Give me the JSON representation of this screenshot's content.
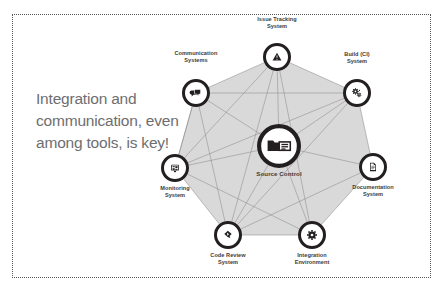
{
  "slide": {
    "headline": "Integration and communication, even among tools, is key!",
    "headline_color": "#6e6e70",
    "background_color": "#ffffff",
    "border_style": "dotted",
    "border_color": "#555555"
  },
  "diagram": {
    "type": "network",
    "shape": "heptagon",
    "polygon_fill": "#d9d9d9",
    "node_ring_color": "#231f20",
    "link_color": "#8c8c8c",
    "center_node": {
      "label": "Source Control",
      "icon": "folder-server-icon",
      "x": 279,
      "y": 146,
      "radius": 22
    },
    "nodes": [
      {
        "id": "issue-tracking",
        "label": "Issue Tracking\nSystem",
        "icon": "warning-triangle-icon",
        "x": 277,
        "y": 57,
        "radius": 14,
        "label_x": 277,
        "label_y": 30
      },
      {
        "id": "build-ci",
        "label": "Build (CI)\nSystem",
        "icon": "gears-icon",
        "x": 357,
        "y": 93,
        "radius": 14,
        "label_x": 357,
        "label_y": 65
      },
      {
        "id": "documentation",
        "label": "Documentation\nSystem",
        "icon": "document-page-icon",
        "x": 373,
        "y": 167,
        "radius": 14,
        "label_x": 373,
        "label_y": 184
      },
      {
        "id": "integration-env",
        "label": "Integration\nEnvironment",
        "icon": "gear-icon",
        "x": 312,
        "y": 235,
        "radius": 14,
        "label_x": 312,
        "label_y": 252
      },
      {
        "id": "code-review",
        "label": "Code Review\nSystem",
        "icon": "stamp-review-icon",
        "x": 228,
        "y": 235,
        "radius": 14,
        "label_x": 228,
        "label_y": 252
      },
      {
        "id": "monitoring",
        "label": "Monitoring\nSystem",
        "icon": "monitor-dashboard-icon",
        "x": 175,
        "y": 168,
        "radius": 14,
        "label_x": 175,
        "label_y": 185
      },
      {
        "id": "communication",
        "label": "Communication\nSystems",
        "icon": "speech-bubbles-icon",
        "x": 196,
        "y": 93,
        "radius": 14,
        "label_x": 196,
        "label_y": 64
      }
    ],
    "links": [
      [
        "issue-tracking",
        "build-ci"
      ],
      [
        "build-ci",
        "documentation"
      ],
      [
        "documentation",
        "integration-env"
      ],
      [
        "integration-env",
        "code-review"
      ],
      [
        "code-review",
        "monitoring"
      ],
      [
        "monitoring",
        "communication"
      ],
      [
        "communication",
        "issue-tracking"
      ],
      [
        "center",
        "issue-tracking"
      ],
      [
        "center",
        "build-ci"
      ],
      [
        "center",
        "documentation"
      ],
      [
        "center",
        "integration-env"
      ],
      [
        "center",
        "code-review"
      ],
      [
        "center",
        "monitoring"
      ],
      [
        "center",
        "communication"
      ],
      [
        "issue-tracking",
        "monitoring"
      ],
      [
        "issue-tracking",
        "code-review"
      ],
      [
        "issue-tracking",
        "integration-env"
      ],
      [
        "build-ci",
        "monitoring"
      ],
      [
        "build-ci",
        "communication"
      ],
      [
        "build-ci",
        "code-review"
      ],
      [
        "communication",
        "code-review"
      ],
      [
        "communication",
        "monitoring"
      ],
      [
        "monitoring",
        "integration-env"
      ],
      [
        "code-review",
        "documentation"
      ]
    ]
  }
}
